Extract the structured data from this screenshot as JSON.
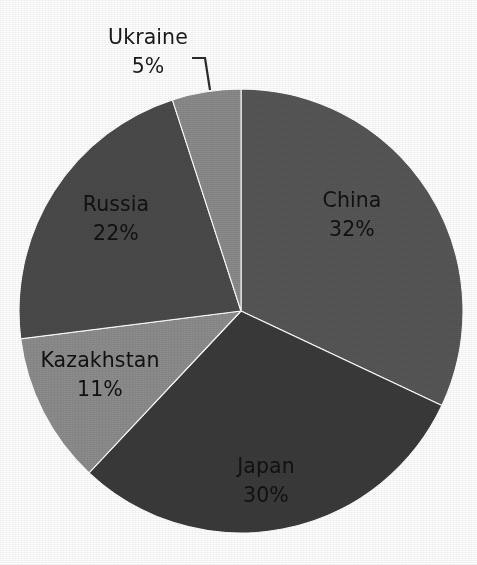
{
  "chart_data": {
    "type": "pie",
    "title": "",
    "subtitle": "",
    "xlabel": "",
    "ylabel": "",
    "legend_position": "none",
    "grid": false,
    "units": "percent",
    "label_format": "{name}\n{value}%",
    "start_angle_deg": 0,
    "direction": "clockwise",
    "categories": [
      "China",
      "Japan",
      "Kazakhstan",
      "Russia",
      "Ukraine"
    ],
    "values": [
      32,
      30,
      11,
      22,
      5
    ],
    "slices": [
      {
        "name": "China",
        "value": 32,
        "value_label": "32%",
        "color": "#565656",
        "label_placement": "inside",
        "label_x": 352,
        "label_y": 207,
        "label_value_x": 352,
        "label_value_y": 236
      },
      {
        "name": "Japan",
        "value": 30,
        "value_label": "30%",
        "color": "#3a3a3a",
        "label_placement": "inside",
        "label_x": 266,
        "label_y": 473,
        "label_value_x": 266,
        "label_value_y": 502
      },
      {
        "name": "Kazakhstan",
        "value": 11,
        "value_label": "11%",
        "color": "#8c8c8c",
        "label_placement": "inside",
        "label_x": 100,
        "label_y": 367,
        "label_value_x": 100,
        "label_value_y": 396
      },
      {
        "name": "Russia",
        "value": 22,
        "value_label": "22%",
        "color": "#4a4a4a",
        "label_placement": "inside",
        "label_x": 116,
        "label_y": 211,
        "label_value_x": 116,
        "label_value_y": 240
      },
      {
        "name": "Ukraine",
        "value": 5,
        "value_label": "5%",
        "color": "#8a8a8a",
        "label_placement": "outside-callout",
        "label_x": 148,
        "label_y": 44,
        "label_value_x": 148,
        "label_value_y": 73
      }
    ],
    "geometry": {
      "center_x": 241,
      "center_y": 311,
      "radius": 222
    },
    "callout": {
      "points": "192,58 205,58 210,90",
      "color": "#2b2b2b"
    }
  },
  "colors": {
    "background": "#ffffff",
    "label_dark": "#111111",
    "label_outside": "#1a1a1a",
    "slice_border": "#ffffff",
    "leader_line": "#2b2b2b"
  }
}
